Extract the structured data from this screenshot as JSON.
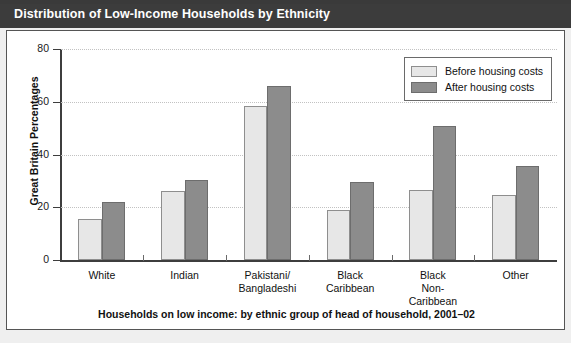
{
  "figure": {
    "title": "Distribution of Low-Income Households by Ethnicity",
    "caption": "Households on low income: by ethnic group of head of household, 2001–02"
  },
  "colors": {
    "title_bar": "#3c3c3c",
    "title_text": "#ffffff",
    "before_housing_costs": "#e7e7e7",
    "after_housing_costs": "#8c8c8c",
    "axis": "#3d3d3d",
    "gridline": "#c2c2c2",
    "panel_background": "#ffffff",
    "page_background": "#efefef"
  },
  "legend": {
    "position": "top-right",
    "entries": [
      {
        "label": "Before housing costs",
        "swatch": "before"
      },
      {
        "label": "After housing costs",
        "swatch": "after"
      }
    ]
  },
  "chart_data": {
    "type": "bar",
    "title": "Distribution of Low-Income Households by Ethnicity",
    "subtitle": "Households on low income: by ethnic group of head of household, 2001–02",
    "xlabel": "",
    "ylabel": "Great Britain Percentages",
    "ylim": [
      0,
      80
    ],
    "yticks": [
      0,
      20,
      40,
      60,
      80
    ],
    "ytick_labels": [
      "0",
      "20",
      "40",
      "60",
      "80"
    ],
    "grid": true,
    "legend_position": "top-right",
    "categories": [
      "White",
      "Pakistani/\nBangladeshi",
      "Indian",
      "Black\nCaribbean",
      "Black\nNon-\nCaribbean",
      "Other"
    ],
    "category_labels": [
      [
        "White"
      ],
      [
        "Indian"
      ],
      [
        "Pakistani/",
        "Bangladeshi"
      ],
      [
        "Black",
        "Caribbean"
      ],
      [
        "Black",
        "Non-",
        "Caribbean"
      ],
      [
        "Other"
      ]
    ],
    "series": [
      {
        "name": "Before housing costs",
        "values": [
          15.5,
          26,
          58.5,
          19,
          26.5,
          24.5
        ]
      },
      {
        "name": "After housing costs",
        "values": [
          22,
          30.5,
          66,
          29.5,
          51,
          35.5
        ]
      }
    ]
  }
}
